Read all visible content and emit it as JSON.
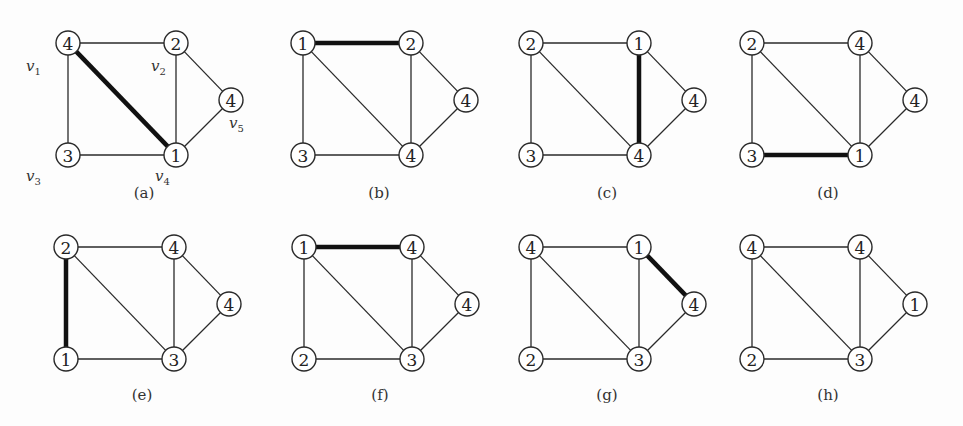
{
  "figure": {
    "vertices": [
      "v1",
      "v2",
      "v3",
      "v4",
      "v5"
    ],
    "vertex_labels": {
      "v1": {
        "main": "v",
        "sub": "1"
      },
      "v2": {
        "main": "v",
        "sub": "2"
      },
      "v3": {
        "main": "v",
        "sub": "3"
      },
      "v4": {
        "main": "v",
        "sub": "4"
      },
      "v5": {
        "main": "v",
        "sub": "5"
      }
    },
    "edges": [
      [
        "v1",
        "v2"
      ],
      [
        "v1",
        "v3"
      ],
      [
        "v1",
        "v4"
      ],
      [
        "v2",
        "v4"
      ],
      [
        "v2",
        "v5"
      ],
      [
        "v5",
        "v4"
      ],
      [
        "v3",
        "v4"
      ]
    ],
    "panels": [
      {
        "caption": "(a)",
        "values": {
          "v1": "4",
          "v2": "2",
          "v3": "3",
          "v4": "1",
          "v5": "4"
        },
        "bold_edge": [
          "v1",
          "v4"
        ],
        "show_vertex_labels": true
      },
      {
        "caption": "(b)",
        "values": {
          "v1": "1",
          "v2": "2",
          "v3": "3",
          "v4": "4",
          "v5": "4"
        },
        "bold_edge": [
          "v1",
          "v2"
        ],
        "show_vertex_labels": false
      },
      {
        "caption": "(c)",
        "values": {
          "v1": "2",
          "v2": "1",
          "v3": "3",
          "v4": "4",
          "v5": "4"
        },
        "bold_edge": [
          "v2",
          "v4"
        ],
        "show_vertex_labels": false
      },
      {
        "caption": "(d)",
        "values": {
          "v1": "2",
          "v2": "4",
          "v3": "3",
          "v4": "1",
          "v5": "4"
        },
        "bold_edge": [
          "v3",
          "v4"
        ],
        "show_vertex_labels": false
      },
      {
        "caption": "(e)",
        "values": {
          "v1": "2",
          "v2": "4",
          "v3": "1",
          "v4": "3",
          "v5": "4"
        },
        "bold_edge": [
          "v1",
          "v3"
        ],
        "show_vertex_labels": false
      },
      {
        "caption": "(f)",
        "values": {
          "v1": "1",
          "v2": "4",
          "v3": "2",
          "v4": "3",
          "v5": "4"
        },
        "bold_edge": [
          "v1",
          "v2"
        ],
        "show_vertex_labels": false
      },
      {
        "caption": "(g)",
        "values": {
          "v1": "4",
          "v2": "1",
          "v3": "2",
          "v4": "3",
          "v5": "4"
        },
        "bold_edge": [
          "v2",
          "v5"
        ],
        "show_vertex_labels": false
      },
      {
        "caption": "(h)",
        "values": {
          "v1": "4",
          "v2": "4",
          "v3": "2",
          "v4": "3",
          "v5": "1"
        },
        "bold_edge": null,
        "show_vertex_labels": false
      }
    ]
  }
}
